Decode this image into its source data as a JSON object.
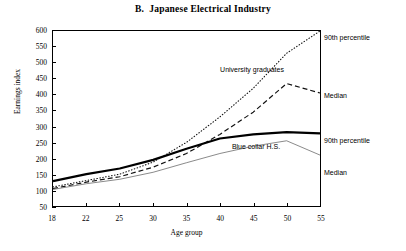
{
  "chart_data": {
    "type": "line",
    "title": "B.  Japanese Electrical Industry",
    "xlabel": "Age group",
    "ylabel": "Earnings index",
    "categories": [
      "18",
      "22",
      "25",
      "30",
      "35",
      "40",
      "45",
      "50",
      "55"
    ],
    "x_ticklabels": [
      "18",
      "22",
      "25",
      "30",
      "35",
      "40",
      "45",
      "50",
      "55"
    ],
    "y_ticklabels": [
      "50",
      "100",
      "150",
      "200",
      "250",
      "300",
      "350",
      "400",
      "450",
      "500",
      "550",
      "600"
    ],
    "ylim": [
      50,
      600
    ],
    "ytick_step": 50,
    "grid": false,
    "legend": "edge-labels",
    "series": [
      {
        "name": "University graduates 90th percentile",
        "style": "dotted",
        "edge_label": "90th percentile",
        "values": [
          110,
          130,
          150,
          188,
          250,
          330,
          420,
          530,
          600
        ]
      },
      {
        "name": "University graduates Median",
        "style": "dashed",
        "edge_label": "Median",
        "values": [
          105,
          125,
          142,
          172,
          215,
          275,
          345,
          435,
          405
        ]
      },
      {
        "name": "Blue collar H.S. 90th percentile",
        "style": "thick-solid",
        "edge_label": "90th percentile",
        "values": [
          128,
          150,
          168,
          195,
          230,
          262,
          275,
          282,
          278
        ]
      },
      {
        "name": "Blue collar H.S. Median",
        "style": "thin-solid",
        "edge_label": "Median",
        "values": [
          102,
          120,
          134,
          156,
          186,
          215,
          238,
          255,
          210
        ]
      }
    ],
    "annotations": [
      {
        "text": "University graduates",
        "x_px": 252,
        "y_px": 69
      },
      {
        "text": "Blue collar H.S.",
        "x_px": 256,
        "y_px": 146
      }
    ],
    "edge_labels": [
      {
        "text": "90th percentile",
        "y_px": 37
      },
      {
        "text": "Median",
        "y_px": 95
      },
      {
        "text": "90th percentile",
        "y_px": 140
      },
      {
        "text": "Median",
        "y_px": 172
      }
    ]
  }
}
